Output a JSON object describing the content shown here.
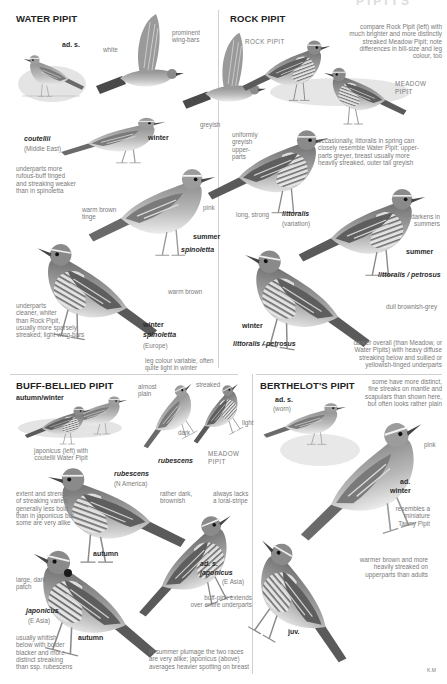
{
  "page": {
    "header_cut": "PIPITS",
    "signature": "K.M"
  },
  "sections": {
    "water_pipit": {
      "title": "WATER PIPIT",
      "labels": {
        "ad_s": "ad. s.",
        "white": "white",
        "prominent_wing_bars": "prominent\nwing-bars",
        "greyish": "greyish",
        "coutellii": "coutellii",
        "middle_east": "(Middle East)",
        "winter": "winter",
        "underparts_rufous": "underparts more\nrufous-buff tinged\nand streaking weaker\nthan in spinoletta",
        "warm_brown_tinge": "warm brown\ntinge",
        "pink": "pink",
        "summer": "summer",
        "spinoletta": "spinoletta",
        "warm_brown": "warm brown",
        "underparts_cleaner": "underparts\ncleaner, whiter\nthan Rock Pipit,\nusually more sparsely\nstreaked; light wing-bars",
        "winter2": "winter",
        "spinoletta2": "spinoletta",
        "europe": "(Europe)",
        "leg_colour": "leg colour variable, often\nquite light in winter"
      }
    },
    "rock_pipit": {
      "title": "ROCK PIPIT",
      "labels": {
        "rock_pipit_caps": "ROCK PIPIT",
        "compare": "compare Rock Pipit (left) with\nmuch brighter and more distinctly\nstreaked Meadow Pipit; note\ndifferences in bill-size and leg\ncolour, too",
        "meadow_pipit": "MEADOW\nPIPIT",
        "uniformly_greyish": "uniformly\ngreyish\nupper-\nparts",
        "occasionally": "occasionally, littoralis in spring can\nclosely resemble Water Pipit: upper-\nparts greyer, breast usually more\nheavily streaked, outer tail greyish",
        "long_strong": "long, strong",
        "littoralis": "littoralis",
        "variation": "(variation)",
        "darkens": "darkens in\nsummers",
        "summer": "summer",
        "littoralis_petrosus": "littoralis / petrosus",
        "dull_brownish_grey": "dull brownish-grey",
        "winter": "winter",
        "littoralis_petrosus2": "littoralis / petrosus",
        "darker_overall": "darker overall (than Meadow, or\nWater Pipits) with heavy diffuse\nstreaking below and sullied or\nyellowish-tinged underparts"
      }
    },
    "buff_bellied_pipit": {
      "title": "BUFF-BELLIED PIPIT",
      "labels": {
        "autumn_winter": "autumn/winter",
        "japonicus_left": "japonicus (left) with\ncoutellii Water Pipit",
        "almost_plain": "almost\nplain",
        "streaked": "streaked",
        "dark": "dark",
        "light": "light",
        "rubescens_small": "rubescens",
        "meadow_pipit": "MEADOW\nPIPIT",
        "rubescens": "rubescens",
        "n_america": "(N America)",
        "extent": "extent and strength\nof streaking varies;\ngenerally less bold\nthan in japonicus but\nsome are very alike",
        "rather_dark": "rather dark,\nbrownish",
        "always_lacks": "always lacks\na loral-stripe",
        "autumn": "autumn",
        "ad_s": "ad. s.",
        "japonicus_ad": "japonicus",
        "e_asia_ad": "(E Asia)",
        "large_dark_patch": "large, dark\npatch",
        "buff_pink": "buff-pink extends\nover entire underparts",
        "japonicus": "japonicus",
        "e_asia": "(E Asia)",
        "autumn2": "autumn",
        "usually_whitish": "usually whitish\nbelow with bolder\nblacker and more\ndistinct streaking\nthan ssp. rubescens",
        "summer_plumage": "in summer plumage the two races\nare very alike; japonicus (above)\naverages heavier spotting on breast"
      }
    },
    "berthelots_pipit": {
      "title": "BERTHELOT'S PIPIT",
      "labels": {
        "ad_s": "ad. s.",
        "worn": "(worn)",
        "some_have": "some have more distinct,\nfine streaks on mantle and\nscapulars than shown here,\nbut often looks rather plain",
        "pink": "pink",
        "ad": "ad.",
        "winter": "winter",
        "resembles": "resembles a\nminiature\nTawny Pipit",
        "warmer_brown": "warmer brown and more\nheavily streaked on\nupperparts than adults",
        "juv": "juv."
      }
    }
  },
  "colors": {
    "ink": "#222222",
    "label": "#7a7a7a",
    "divider": "#d0d0d0",
    "bird_dark": "#5a5a5a",
    "bird_mid": "#9a9a9a",
    "bird_light": "#d6d6d6"
  }
}
